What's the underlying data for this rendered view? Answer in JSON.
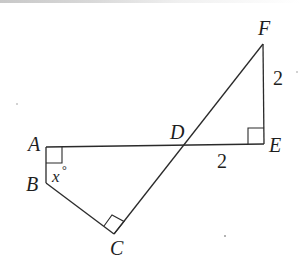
{
  "diagram": {
    "points": {
      "A": {
        "label": "A",
        "x": 46,
        "y": 147
      },
      "B": {
        "label": "B",
        "x": 46,
        "y": 183
      },
      "C": {
        "label": "C",
        "x": 114,
        "y": 234
      },
      "D": {
        "label": "D",
        "x": 183,
        "y": 146
      },
      "E": {
        "label": "E",
        "x": 264,
        "y": 144
      },
      "F": {
        "label": "F",
        "x": 263,
        "y": 44
      }
    },
    "segments": [
      {
        "from": "A",
        "to": "E"
      },
      {
        "from": "A",
        "to": "B"
      },
      {
        "from": "B",
        "to": "C"
      },
      {
        "from": "C",
        "to": "F"
      },
      {
        "from": "E",
        "to": "F"
      }
    ],
    "right_angles": [
      "A",
      "C",
      "E"
    ],
    "labels": {
      "A": "A",
      "B": "B",
      "C": "C",
      "D": "D",
      "E": "E",
      "F": "F",
      "DE_length": "2",
      "EF_length": "2",
      "angle_B_var": "x",
      "angle_B_unit": "°"
    },
    "colors": {
      "line": "#2a2a2a",
      "text": "#1e1e1e",
      "background": "#ffffff"
    }
  }
}
